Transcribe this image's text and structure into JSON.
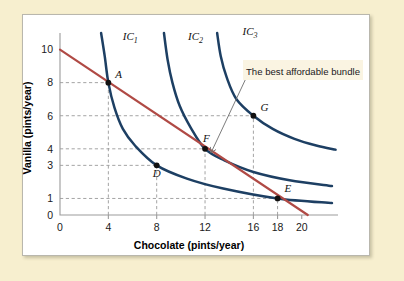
{
  "figure": {
    "background_color": "#f7efcf",
    "panel_color": "#ffffff",
    "annotation": "The best affordable bundle"
  },
  "chart_data": {
    "type": "line",
    "title": "",
    "xlabel": "Chocolate (pints/year)",
    "ylabel": "Vanilla (pints/year)",
    "xlim": [
      0,
      23
    ],
    "ylim": [
      0,
      11
    ],
    "xticks": [
      0,
      4,
      8,
      12,
      16,
      18,
      20
    ],
    "yticks": [
      0,
      1,
      3,
      4,
      6,
      8,
      10
    ],
    "grid": "dashed-to-points",
    "legend": "inline-curve-labels",
    "curve_color": "#1d3f63",
    "budget_color": "#b04a45",
    "series": [
      {
        "name": "IC1",
        "label": "IC",
        "subscript": "1",
        "kind": "indifference-curve",
        "label_x": 5.2,
        "label_y": 10.6,
        "points": [
          [
            3.4,
            11.0
          ],
          [
            3.7,
            9.6
          ],
          [
            4.0,
            8.0
          ],
          [
            4.5,
            6.5
          ],
          [
            5.2,
            5.2
          ],
          [
            6.2,
            4.2
          ],
          [
            8.0,
            3.0
          ],
          [
            10.5,
            2.2
          ],
          [
            13.5,
            1.6
          ],
          [
            18.0,
            1.0
          ],
          [
            22.5,
            0.72
          ]
        ]
      },
      {
        "name": "IC2",
        "label": "IC",
        "subscript": "2",
        "kind": "indifference-curve",
        "label_x": 10.6,
        "label_y": 10.6,
        "points": [
          [
            8.6,
            11.0
          ],
          [
            8.9,
            9.4
          ],
          [
            9.3,
            8.0
          ],
          [
            9.9,
            6.6
          ],
          [
            10.8,
            5.3
          ],
          [
            12.0,
            4.0
          ],
          [
            13.6,
            3.3
          ],
          [
            16.0,
            2.6
          ],
          [
            19.0,
            2.1
          ],
          [
            22.5,
            1.75
          ]
        ]
      },
      {
        "name": "IC3",
        "label": "IC",
        "subscript": "3",
        "kind": "indifference-curve",
        "label_x": 15.1,
        "label_y": 10.9,
        "points": [
          [
            13.0,
            11.0
          ],
          [
            13.3,
            9.6
          ],
          [
            13.8,
            8.3
          ],
          [
            14.6,
            7.0
          ],
          [
            16.0,
            6.0
          ],
          [
            17.6,
            5.2
          ],
          [
            19.4,
            4.6
          ],
          [
            21.2,
            4.2
          ],
          [
            22.8,
            3.95
          ]
        ]
      },
      {
        "name": "Budget line",
        "kind": "budget-line",
        "points": [
          [
            0,
            10.0
          ],
          [
            20.5,
            0.0
          ]
        ]
      }
    ],
    "points": [
      {
        "label": "A",
        "x": 4,
        "y": 8,
        "curve": "IC1",
        "label_dx": 7,
        "label_dy": -5
      },
      {
        "label": "D",
        "x": 8,
        "y": 3,
        "curve": "IC1",
        "label_dx": -4,
        "label_dy": 12
      },
      {
        "label": "F",
        "x": 12,
        "y": 4,
        "curve": "IC2",
        "label_dx": -2,
        "label_dy": -7
      },
      {
        "label": "G",
        "x": 16,
        "y": 6,
        "curve": "IC3",
        "label_dx": 7,
        "label_dy": -5
      },
      {
        "label": "E",
        "x": 18,
        "y": 1,
        "curve": "IC1",
        "label_dx": 7,
        "label_dy": -6
      }
    ],
    "gridlines": [
      {
        "x": 4,
        "y": 8
      },
      {
        "x": 8,
        "y": 3
      },
      {
        "x": 12,
        "y": 4
      },
      {
        "x": 16,
        "y": 6
      },
      {
        "x": 18,
        "y": 1
      }
    ],
    "annotation": {
      "text": "The best affordable bundle",
      "target_point": "F"
    }
  }
}
